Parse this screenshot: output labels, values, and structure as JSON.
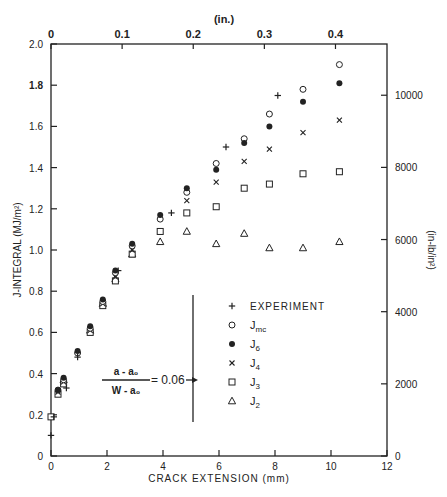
{
  "chart_data": {
    "type": "scatter",
    "title": "",
    "xlabel": "CRACK EXTENSION (mm)",
    "ylabel": "J-INTEGRAL (MJ/m²)",
    "x2label": "(in.)",
    "y2label": "(in-lb/in²)",
    "xlim": [
      0,
      12
    ],
    "ylim": [
      0,
      2.0
    ],
    "x_ticks": [
      0,
      2,
      4,
      6,
      8,
      10,
      12
    ],
    "y_ticks": [
      0,
      0.2,
      0.4,
      0.6,
      0.8,
      1.0,
      1.2,
      1.4,
      1.6,
      1.8,
      2.0
    ],
    "y_tick_labels": [
      "0",
      "0.2",
      "0.4",
      "0.6",
      "0.8",
      "1.0",
      "1.2",
      "1.4",
      "1.6",
      "1.8",
      "2.0"
    ],
    "x2_ticks": [
      0,
      0.1,
      0.2,
      0.3,
      0.4
    ],
    "x2_tick_labels": [
      "0",
      "0.1",
      "0.2",
      "0.3",
      "0.4"
    ],
    "y2_ticks": [
      0,
      2000,
      4000,
      6000,
      8000,
      10000
    ],
    "y2_tick_labels": [
      "0",
      "2000",
      "4000",
      "6000",
      "8000",
      "10000"
    ],
    "grid": false,
    "legend_position": "center-right inside",
    "annotation": {
      "numerator": "a - a₀",
      "denominator": "W - a₀",
      "value": "= 0.06"
    },
    "series": [
      {
        "name": "EXPERIMENT",
        "marker": "plus",
        "x": [
          0.0,
          0.1,
          0.55,
          0.95,
          2.4,
          4.3,
          6.25,
          8.1
        ],
        "y": [
          0.1,
          0.19,
          0.33,
          0.48,
          0.9,
          1.18,
          1.5,
          1.75
        ]
      },
      {
        "name": "Jmc",
        "marker": "open-circle",
        "x": [
          0.25,
          0.45,
          0.95,
          1.4,
          1.85,
          2.3,
          2.9,
          3.9,
          4.85,
          5.9,
          6.9,
          7.8,
          9.0,
          10.3
        ],
        "y": [
          0.32,
          0.37,
          0.5,
          0.62,
          0.75,
          0.89,
          1.02,
          1.15,
          1.28,
          1.42,
          1.54,
          1.66,
          1.78,
          1.9
        ]
      },
      {
        "name": "J6",
        "marker": "filled-circle",
        "x": [
          0.25,
          0.45,
          0.95,
          1.4,
          1.85,
          2.3,
          2.9,
          3.9,
          4.85,
          5.9,
          6.9,
          7.8,
          9.0,
          10.3
        ],
        "y": [
          0.32,
          0.38,
          0.51,
          0.63,
          0.76,
          0.9,
          1.03,
          1.17,
          1.3,
          1.39,
          1.52,
          1.6,
          1.72,
          1.81
        ]
      },
      {
        "name": "J4",
        "marker": "x",
        "x": [
          0.25,
          0.45,
          1.4,
          1.85,
          2.3,
          2.9,
          4.85,
          5.9,
          6.9,
          7.8,
          9.0,
          10.3
        ],
        "y": [
          0.31,
          0.36,
          0.61,
          0.74,
          0.87,
          1.0,
          1.24,
          1.33,
          1.43,
          1.49,
          1.57,
          1.63
        ]
      },
      {
        "name": "J3",
        "marker": "open-square",
        "x": [
          0.0,
          0.25,
          0.45,
          1.4,
          1.85,
          2.3,
          2.9,
          3.9,
          4.85,
          5.9,
          6.9,
          7.8,
          9.0,
          10.3
        ],
        "y": [
          0.19,
          0.3,
          0.35,
          0.6,
          0.73,
          0.85,
          0.98,
          1.09,
          1.18,
          1.21,
          1.3,
          1.32,
          1.37,
          1.38
        ]
      },
      {
        "name": "J2",
        "marker": "open-triangle",
        "x": [
          0.45,
          1.4,
          1.85,
          2.3,
          2.9,
          3.9,
          4.85,
          5.9,
          6.9,
          7.8,
          9.0,
          10.3
        ],
        "y": [
          0.37,
          0.61,
          0.74,
          0.86,
          0.98,
          1.04,
          1.09,
          1.03,
          1.08,
          1.01,
          1.01,
          1.04
        ]
      }
    ]
  },
  "legend": {
    "items": [
      {
        "label": "EXPERIMENT",
        "marker": "plus"
      },
      {
        "label": "Jmc",
        "marker": "open-circle"
      },
      {
        "label": "J6",
        "marker": "filled-circle"
      },
      {
        "label": "J4",
        "marker": "x"
      },
      {
        "label": "J3",
        "marker": "open-square"
      },
      {
        "label": "J2",
        "marker": "open-triangle"
      }
    ]
  },
  "axes": {
    "x_title": "CRACK EXTENSION (mm)",
    "y_title": "J-INTEGRAL (MJ/m²)",
    "x2_title": "(in.)",
    "y2_title": "(in-lb/in²)"
  },
  "annotation": {
    "numerator": "a - a₀",
    "denominator": "W - a₀",
    "value": "= 0.06"
  },
  "colors": {
    "ink": "#222222",
    "background": "#ffffff"
  }
}
